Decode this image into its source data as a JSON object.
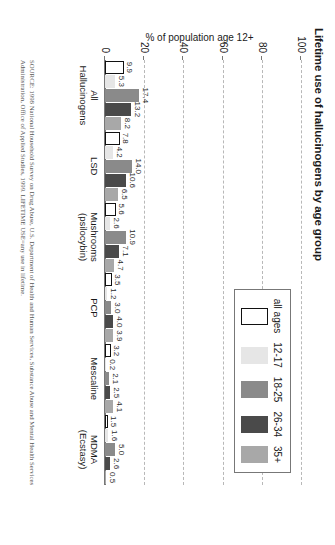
{
  "chart_data": {
    "type": "bar",
    "title": "Lifetime use of hallucinogens by age group",
    "xlabel": "",
    "ylabel": "% of population age 12+",
    "ylim": [
      0,
      100
    ],
    "yticks": [
      "0",
      "20",
      "40",
      "60",
      "80",
      "100"
    ],
    "grid": true,
    "legend_position": "top-right",
    "orientation": "rotated-90-clockwise",
    "categories": [
      "All Hallucinogens",
      "LSD",
      "Mushrooms (psilocybin)",
      "PCP",
      "Mescaline",
      "MDMA (Ecstasy)"
    ],
    "series": [
      {
        "name": "all ages",
        "color": "#ffffff",
        "values": [
          9.9,
          7.8,
          5.6,
          3.5,
          3.2,
          1.5
        ]
      },
      {
        "name": "12-17",
        "color": "#e6e6e6",
        "values": [
          5.3,
          4.2,
          2.6,
          1.2,
          0.2,
          1.6
        ]
      },
      {
        "name": "18-25",
        "color": "#8a8a8a",
        "values": [
          17.4,
          14.0,
          10.9,
          3.0,
          2.1,
          5.0
        ]
      },
      {
        "name": "26-34",
        "color": "#4a4a4a",
        "values": [
          13.2,
          10.6,
          7.1,
          4.0,
          2.5,
          2.6
        ]
      },
      {
        "name": "35+",
        "color": "#a8a8a8",
        "values": [
          8.2,
          6.5,
          4.7,
          3.9,
          4.1,
          0.5
        ]
      }
    ],
    "source": "SOURCE: 1998 National Household Survey on Drug Abuse, U.S. Department of Health and Human Services, Substance Abuse and Mental Health Services Administration, Office of Applied Studies, 1999. LIFETIME USE=any use in lifetime."
  },
  "colors": {
    "axis": "#777777",
    "grid": "#b8b8b8",
    "text": "#1a1a1a",
    "source_text": "#555555"
  }
}
